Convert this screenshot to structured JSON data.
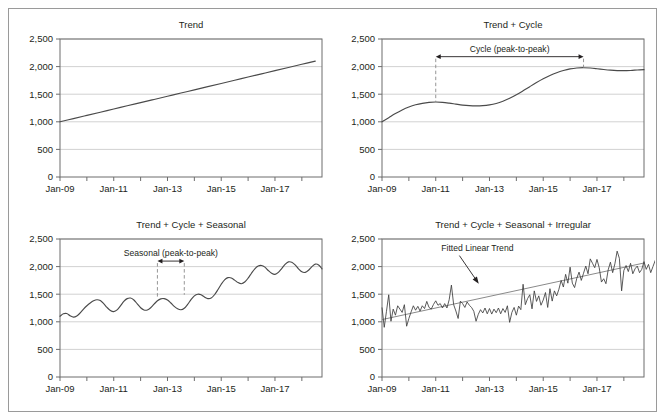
{
  "figure": {
    "border_color": "#9a9a9a",
    "background": "#ffffff",
    "series_color": "#4a4a4a",
    "trend_color": "#8a8a8a",
    "grid_color": "#bfbfbf",
    "axis_color": "#6d6d6d"
  },
  "chart_data": [
    {
      "id": "trend",
      "type": "line",
      "title": "Trend",
      "xlabel": "",
      "ylabel": "",
      "ylim": [
        0,
        2500
      ],
      "yticks": [
        0,
        500,
        1000,
        1500,
        2000,
        2500
      ],
      "ytick_labels": [
        "0",
        "500",
        "1,000",
        "1,500",
        "2,000",
        "2,500"
      ],
      "xlim": [
        2009.0,
        2018.75
      ],
      "xticks": [
        2009,
        2011,
        2013,
        2015,
        2017
      ],
      "xtick_labels": [
        "Jan-09",
        "Jan-11",
        "Jan-13",
        "Jan-15",
        "Jan-17"
      ],
      "xminor_ticks": [
        2010,
        2012,
        2014,
        2016,
        2018
      ],
      "grid": true,
      "legend": "none",
      "series": [
        {
          "name": "Trend",
          "x": [
            2009.0,
            2009.5,
            2010.0,
            2010.5,
            2011.0,
            2011.5,
            2012.0,
            2012.5,
            2013.0,
            2013.5,
            2014.0,
            2014.5,
            2015.0,
            2015.5,
            2016.0,
            2016.5,
            2017.0,
            2017.5,
            2018.0,
            2018.5
          ],
          "values": [
            1000,
            1058,
            1116,
            1174,
            1232,
            1290,
            1347,
            1405,
            1463,
            1521,
            1579,
            1637,
            1695,
            1753,
            1811,
            1868,
            1926,
            1984,
            2042,
            2100
          ]
        }
      ],
      "annotations": []
    },
    {
      "id": "trend-cycle",
      "type": "line",
      "title": "Trend + Cycle",
      "xlabel": "",
      "ylabel": "",
      "ylim": [
        0,
        2500
      ],
      "yticks": [
        0,
        500,
        1000,
        1500,
        2000,
        2500
      ],
      "ytick_labels": [
        "0",
        "500",
        "1,000",
        "1,500",
        "2,000",
        "2,500"
      ],
      "xlim": [
        2009.0,
        2018.75
      ],
      "xticks": [
        2009,
        2011,
        2013,
        2015,
        2017
      ],
      "xtick_labels": [
        "Jan-09",
        "Jan-11",
        "Jan-13",
        "Jan-15",
        "Jan-17"
      ],
      "xminor_ticks": [
        2010,
        2012,
        2014,
        2016,
        2018
      ],
      "grid": true,
      "legend": "none",
      "series": [
        {
          "name": "Trend + Cycle",
          "x": [
            2009.0,
            2009.25,
            2009.5,
            2009.75,
            2010.0,
            2010.25,
            2010.5,
            2010.75,
            2011.0,
            2011.25,
            2011.5,
            2011.75,
            2012.0,
            2012.25,
            2012.5,
            2012.75,
            2013.0,
            2013.25,
            2013.5,
            2013.75,
            2014.0,
            2014.25,
            2014.5,
            2014.75,
            2015.0,
            2015.25,
            2015.5,
            2015.75,
            2016.0,
            2016.25,
            2016.5,
            2016.75,
            2017.0,
            2017.25,
            2017.5,
            2017.75,
            2018.0,
            2018.25,
            2018.5,
            2018.75
          ],
          "values": [
            1000,
            1075,
            1150,
            1215,
            1268,
            1308,
            1335,
            1352,
            1358,
            1352,
            1338,
            1320,
            1303,
            1292,
            1288,
            1292,
            1306,
            1332,
            1372,
            1425,
            1490,
            1562,
            1637,
            1710,
            1778,
            1838,
            1888,
            1928,
            1958,
            1975,
            1980,
            1974,
            1962,
            1948,
            1936,
            1928,
            1926,
            1930,
            1938,
            1945
          ]
        }
      ],
      "annotations": [
        {
          "type": "double-arrow-with-droplines",
          "label": "Cycle (peak-to-peak)",
          "x_start": 2011.0,
          "x_end": 2016.5,
          "arrow_y": 2180,
          "drop_start_y": 1358,
          "drop_end_y": 1980
        }
      ]
    },
    {
      "id": "trend-cycle-seasonal",
      "type": "line",
      "title": "Trend + Cycle + Seasonal",
      "xlabel": "",
      "ylabel": "",
      "ylim": [
        0,
        2500
      ],
      "yticks": [
        0,
        500,
        1000,
        1500,
        2000,
        2500
      ],
      "ytick_labels": [
        "0",
        "500",
        "1,000",
        "1,500",
        "2,000",
        "2,500"
      ],
      "xlim": [
        2009.0,
        2018.75
      ],
      "xticks": [
        2009,
        2011,
        2013,
        2015,
        2017
      ],
      "xtick_labels": [
        "Jan-09",
        "Jan-11",
        "Jan-13",
        "Jan-15",
        "Jan-17"
      ],
      "xminor_ticks": [
        2010,
        2012,
        2014,
        2016,
        2018
      ],
      "grid": true,
      "legend": "none",
      "series": [
        {
          "name": "Trend + Cycle + Seasonal",
          "seasonal_period": 1.0,
          "seasonal_amplitude": 120,
          "x": [
            2009.0,
            2009.125,
            2009.25,
            2009.375,
            2009.5,
            2009.625,
            2009.75,
            2009.875,
            2010.0,
            2010.125,
            2010.25,
            2010.375,
            2010.5,
            2010.625,
            2010.75,
            2010.875,
            2011.0,
            2011.125,
            2011.25,
            2011.375,
            2011.5,
            2011.625,
            2011.75,
            2011.875,
            2012.0,
            2012.125,
            2012.25,
            2012.375,
            2012.5,
            2012.625,
            2012.75,
            2012.875,
            2013.0,
            2013.125,
            2013.25,
            2013.375,
            2013.5,
            2013.625,
            2013.75,
            2013.875,
            2014.0,
            2014.125,
            2014.25,
            2014.375,
            2014.5,
            2014.625,
            2014.75,
            2014.875,
            2015.0,
            2015.125,
            2015.25,
            2015.375,
            2015.5,
            2015.625,
            2015.75,
            2015.875,
            2016.0,
            2016.125,
            2016.25,
            2016.375,
            2016.5,
            2016.625,
            2016.75,
            2016.875,
            2017.0,
            2017.125,
            2017.25,
            2017.375,
            2017.5,
            2017.625,
            2017.75,
            2017.875,
            2018.0,
            2018.125,
            2018.25,
            2018.375,
            2018.5,
            2018.625,
            2018.75
          ],
          "values": [
            1100,
            1145,
            1150,
            1110,
            1085,
            1105,
            1160,
            1230,
            1290,
            1340,
            1380,
            1400,
            1385,
            1330,
            1260,
            1205,
            1185,
            1215,
            1290,
            1370,
            1420,
            1430,
            1395,
            1325,
            1255,
            1215,
            1215,
            1255,
            1320,
            1380,
            1415,
            1420,
            1395,
            1340,
            1280,
            1235,
            1218,
            1245,
            1315,
            1400,
            1470,
            1500,
            1490,
            1450,
            1420,
            1430,
            1490,
            1580,
            1680,
            1760,
            1800,
            1795,
            1755,
            1710,
            1690,
            1720,
            1790,
            1880,
            1960,
            2010,
            2020,
            1990,
            1930,
            1880,
            1860,
            1895,
            1965,
            2040,
            2085,
            2080,
            2030,
            1960,
            1905,
            1895,
            1935,
            2000,
            2045,
            2030,
            1960
          ]
        }
      ],
      "annotations": [
        {
          "type": "double-arrow-with-droplines",
          "label": "Seasonal (peak-to-peak)",
          "x_start": 2012.625,
          "x_end": 2013.625,
          "arrow_y": 2100,
          "drop_start_y": 1420,
          "drop_end_y": 1490
        }
      ]
    },
    {
      "id": "trend-cycle-seasonal-irregular",
      "type": "line",
      "title": "Trend + Cycle + Seasonal + Irregular",
      "xlabel": "",
      "ylabel": "",
      "ylim": [
        0,
        2500
      ],
      "yticks": [
        0,
        500,
        1000,
        1500,
        2000,
        2500
      ],
      "ytick_labels": [
        "0",
        "500",
        "1,000",
        "1,500",
        "2,000",
        "2,500"
      ],
      "xlim": [
        2009.0,
        2018.75
      ],
      "xticks": [
        2009,
        2011,
        2013,
        2015,
        2017
      ],
      "xtick_labels": [
        "Jan-09",
        "Jan-11",
        "Jan-13",
        "Jan-15",
        "Jan-17"
      ],
      "xminor_ticks": [
        2010,
        2012,
        2014,
        2016,
        2018
      ],
      "grid": true,
      "legend": "none",
      "series": [
        {
          "name": "Observed",
          "style": "noisy",
          "x_start": 2009.0,
          "x_step": 0.0833333,
          "values": [
            1260,
            900,
            1190,
            1490,
            1010,
            1230,
            1120,
            1290,
            1230,
            1170,
            1310,
            920,
            1060,
            1180,
            1290,
            1210,
            1280,
            1195,
            1290,
            1240,
            1370,
            1260,
            1230,
            1315,
            1380,
            1300,
            1330,
            1250,
            1330,
            1250,
            1400,
            1665,
            1310,
            1195,
            1060,
            1375,
            1330,
            1260,
            1360,
            1300,
            1260,
            1190,
            1010,
            1135,
            1220,
            1160,
            1250,
            1145,
            1240,
            1140,
            1230,
            1165,
            1250,
            1145,
            1240,
            1170,
            1290,
            990,
            1170,
            1260,
            1120,
            1285,
            1220,
            1680,
            1310,
            1420,
            1490,
            1235,
            1560,
            1370,
            1470,
            1300,
            1395,
            1530,
            1260,
            1600,
            1375,
            1560,
            1470,
            1590,
            1750,
            1630,
            1860,
            1700,
            1990,
            1700,
            1620,
            1790,
            1900,
            1750,
            1880,
            2010,
            1870,
            2140,
            2060,
            1980,
            2130,
            1980,
            1720,
            1780,
            1690,
            1940,
            2080,
            1890,
            2050,
            2280,
            2150,
            1560,
            1930,
            2020,
            1910,
            2060,
            1870,
            1960,
            2010,
            1890,
            1950,
            2090,
            1950,
            2040,
            1890,
            2000,
            2110,
            1960,
            2060,
            2020,
            2130,
            2090
          ]
        }
      ],
      "trendline": {
        "name": "Fitted Linear Trend",
        "x": [
          2009.0,
          2018.75
        ],
        "values": [
          1040,
          2065
        ]
      },
      "annotations": [
        {
          "type": "arrow-label",
          "label": "Fitted Linear Trend",
          "label_x": 2012.55,
          "label_y": 2290,
          "tip_x": 2012.6,
          "tip_y": 1690
        }
      ]
    }
  ]
}
